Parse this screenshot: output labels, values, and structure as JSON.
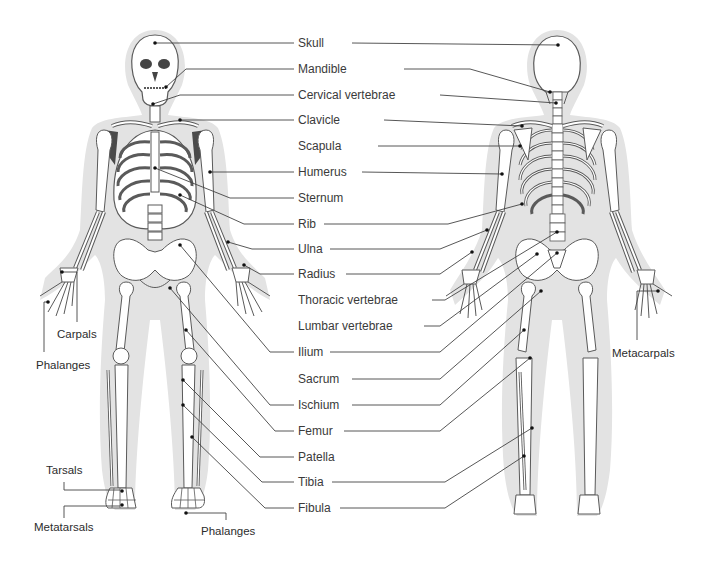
{
  "diagram": {
    "colors": {
      "silhouette": "#e3e3e3",
      "bone_fill": "#ffffff",
      "bone_stroke": "#5a5a5a",
      "dark_shadow": "#4a4a4a",
      "leader_line": "#444444",
      "text": "#3a3a3a"
    },
    "center_labels": [
      {
        "id": "skull",
        "text": "Skull",
        "y": 42
      },
      {
        "id": "mandible",
        "text": "Mandible",
        "y": 69
      },
      {
        "id": "cervical",
        "text": "Cervical vertebrae",
        "y": 95
      },
      {
        "id": "clavicle",
        "text": "Clavicle",
        "y": 120
      },
      {
        "id": "scapula",
        "text": "Scapula",
        "y": 146
      },
      {
        "id": "humerus",
        "text": "Humerus",
        "y": 172
      },
      {
        "id": "sternum",
        "text": "Sternum",
        "y": 198
      },
      {
        "id": "rib",
        "text": "Rib",
        "y": 224
      },
      {
        "id": "ulna",
        "text": "Ulna",
        "y": 249
      },
      {
        "id": "radius",
        "text": "Radius",
        "y": 274
      },
      {
        "id": "thoracic",
        "text": "Thoracic vertebrae",
        "y": 300
      },
      {
        "id": "lumbar",
        "text": "Lumbar vertebrae",
        "y": 326
      },
      {
        "id": "ilium",
        "text": "Ilium",
        "y": 352
      },
      {
        "id": "sacrum",
        "text": "Sacrum",
        "y": 379
      },
      {
        "id": "ischium",
        "text": "Ischium",
        "y": 405
      },
      {
        "id": "femur",
        "text": "Femur",
        "y": 431
      },
      {
        "id": "patella",
        "text": "Patella",
        "y": 457
      },
      {
        "id": "tibia",
        "text": "Tibia",
        "y": 482
      },
      {
        "id": "fibula",
        "text": "Fibula",
        "y": 508
      }
    ],
    "side_labels": {
      "carpals": "Carpals",
      "phalanges_hand": "Phalanges",
      "metacarpals": "Metacarpals",
      "tarsals": "Tarsals",
      "metatarsals": "Metatarsals",
      "phalanges_foot": "Phalanges"
    },
    "views": [
      "anterior (front)",
      "posterior (back)"
    ]
  }
}
